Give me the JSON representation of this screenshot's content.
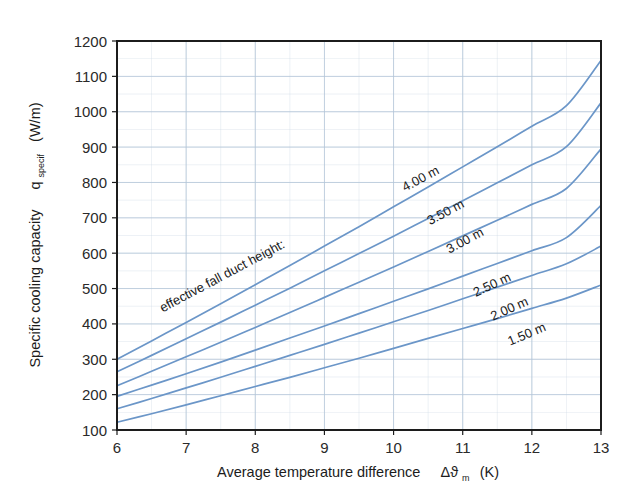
{
  "chart_data": {
    "type": "line",
    "title": "",
    "xlabel": "Average temperature difference   Δϑm (K)",
    "xlabel_main": "Average temperature difference",
    "xlabel_symbol": "Δϑ",
    "xlabel_symbol_sub": "m",
    "xlabel_unit": "(K)",
    "ylabel_main": "Specific cooling capacity",
    "ylabel_symbol": "q",
    "ylabel_symbol_sub": "specif",
    "ylabel_unit": "(W/m)",
    "xlim": [
      6,
      13
    ],
    "ylim": [
      100,
      1200
    ],
    "xticks": [
      6,
      7,
      8,
      9,
      10,
      11,
      12,
      13
    ],
    "yticks": [
      100,
      200,
      300,
      400,
      500,
      600,
      700,
      800,
      900,
      1000,
      1100,
      1200
    ],
    "xtick_labels": [
      "6",
      "7",
      "8",
      "9",
      "10",
      "11",
      "12",
      "13"
    ],
    "ytick_labels": [
      "100",
      "200",
      "300",
      "400",
      "500",
      "600",
      "700",
      "800",
      "900",
      "1000",
      "1100",
      "1200"
    ],
    "grid": true,
    "grid_minor_x_step": 0.5,
    "grid_minor_y_step": 50,
    "legend": "inline-curve-labels",
    "legend_prefix": "effective fall duct height:",
    "curve_color": "#6b96c8",
    "grid_color": "#c9d6e4",
    "axis_color": "#1c1c1c",
    "x": [
      6,
      6.5,
      7,
      7.5,
      8,
      8.5,
      9,
      9.5,
      10,
      10.5,
      11,
      11.5,
      12,
      12.5,
      13
    ],
    "series": [
      {
        "name": "4.00 m",
        "label": "4.00 m",
        "values": [
          300,
          352,
          404,
          457,
          511,
          565,
          620,
          675,
          731,
          787,
          844,
          901,
          959,
          1017,
          1145
        ]
      },
      {
        "name": "3.50 m",
        "label": "3.50 m",
        "values": [
          265,
          311,
          358,
          405,
          453,
          501,
          550,
          599,
          648,
          698,
          748,
          799,
          850,
          901,
          1025
        ]
      },
      {
        "name": "3.00 m",
        "label": "3.00 m",
        "values": [
          225,
          266,
          307,
          348,
          390,
          432,
          475,
          518,
          561,
          605,
          649,
          693,
          738,
          783,
          895
        ]
      },
      {
        "name": "2.50 m",
        "label": "2.50 m",
        "values": [
          195,
          227,
          259,
          292,
          326,
          360,
          394,
          429,
          464,
          499,
          535,
          571,
          607,
          644,
          735
        ]
      },
      {
        "name": "2.00 m",
        "label": "2.00 m",
        "values": [
          160,
          189,
          219,
          249,
          280,
          311,
          342,
          374,
          406,
          438,
          471,
          504,
          537,
          570,
          620
        ]
      },
      {
        "name": "1.50 m",
        "label": "1.50 m",
        "values": [
          122,
          146,
          171,
          197,
          223,
          249,
          276,
          303,
          331,
          359,
          387,
          415,
          444,
          473,
          510
        ]
      }
    ],
    "curve_label_anchors": [
      {
        "label": "4.00 m",
        "x": 10.42,
        "y": 800,
        "rotation": -28
      },
      {
        "label": "3.50 m",
        "x": 10.78,
        "y": 705,
        "rotation": -28
      },
      {
        "label": "3.00 m",
        "x": 11.06,
        "y": 625,
        "rotation": -28
      },
      {
        "label": "2.50 m",
        "x": 11.45,
        "y": 500,
        "rotation": -25
      },
      {
        "label": "2.00 m",
        "x": 11.7,
        "y": 432,
        "rotation": -24
      },
      {
        "label": "1.50 m",
        "x": 11.95,
        "y": 360,
        "rotation": -23
      }
    ],
    "legend_prefix_anchor": {
      "x": 7.55,
      "y": 525,
      "rotation": -28
    }
  }
}
